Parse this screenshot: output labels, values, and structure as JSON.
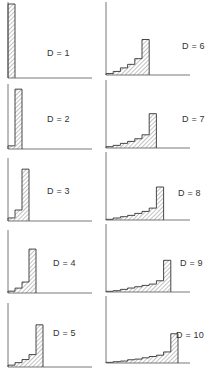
{
  "chart_data": [
    {
      "type": "bar",
      "label": "D = 1",
      "title": "D = 1",
      "values": [
        1.0
      ],
      "ylim": [
        0,
        1
      ]
    },
    {
      "type": "bar",
      "label": "D = 2",
      "title": "D = 2",
      "values": [
        0.05,
        0.95
      ],
      "ylim": [
        0,
        1
      ]
    },
    {
      "type": "bar",
      "label": "D = 3",
      "title": "D = 3",
      "values": [
        0.05,
        0.18,
        0.85
      ],
      "ylim": [
        0,
        1
      ]
    },
    {
      "type": "bar",
      "label": "D = 4",
      "title": "D = 4",
      "values": [
        0.03,
        0.08,
        0.18,
        0.72
      ],
      "ylim": [
        0,
        1
      ]
    },
    {
      "type": "bar",
      "label": "D = 5",
      "title": "D = 5",
      "values": [
        0.03,
        0.07,
        0.12,
        0.2,
        0.68
      ],
      "ylim": [
        0,
        1
      ]
    },
    {
      "type": "bar",
      "label": "D = 6",
      "title": "D = 6",
      "values": [
        0.02,
        0.05,
        0.1,
        0.15,
        0.23,
        0.5
      ],
      "ylim": [
        0,
        1
      ]
    },
    {
      "type": "bar",
      "label": "D = 7",
      "title": "D = 7",
      "values": [
        0.02,
        0.04,
        0.07,
        0.1,
        0.14,
        0.2,
        0.52
      ],
      "ylim": [
        0,
        1
      ]
    },
    {
      "type": "bar",
      "label": "D = 8",
      "title": "D = 8",
      "values": [
        0.01,
        0.03,
        0.05,
        0.07,
        0.1,
        0.13,
        0.18,
        0.5
      ],
      "ylim": [
        0,
        1
      ]
    },
    {
      "type": "bar",
      "label": "D = 9",
      "title": "D = 9",
      "values": [
        0.01,
        0.02,
        0.04,
        0.06,
        0.08,
        0.1,
        0.12,
        0.17,
        0.48
      ],
      "ylim": [
        0,
        1
      ]
    },
    {
      "type": "bar",
      "label": "D = 10",
      "title": "D = 10",
      "values": [
        0.01,
        0.02,
        0.03,
        0.05,
        0.06,
        0.08,
        0.1,
        0.12,
        0.17,
        0.45
      ],
      "ylim": [
        0,
        1
      ]
    }
  ],
  "panels": [
    {
      "label": "D = 1"
    },
    {
      "label": "D = 2"
    },
    {
      "label": "D = 3"
    },
    {
      "label": "D = 4"
    },
    {
      "label": "D = 5"
    },
    {
      "label": "D = 6"
    },
    {
      "label": "D = 7"
    },
    {
      "label": "D = 8"
    },
    {
      "label": "D = 9"
    },
    {
      "label": "D = 10"
    }
  ]
}
